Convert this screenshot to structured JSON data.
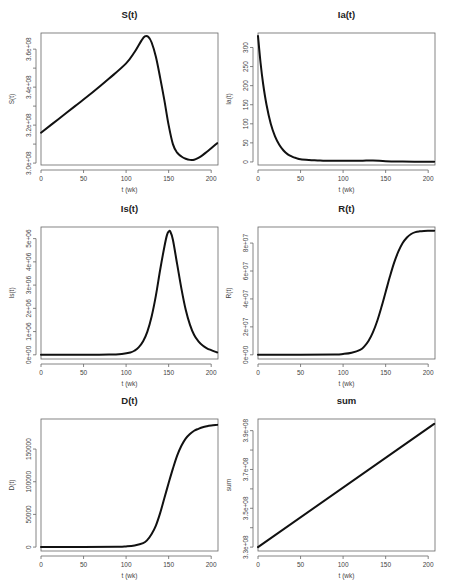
{
  "figure": {
    "layout": "3 rows x 2 columns",
    "xlabel": "t (wk)"
  },
  "chart_data": [
    {
      "id": "S",
      "type": "line",
      "title": "S(t)",
      "xlabel": "t (wk)",
      "ylabel": "S(t)",
      "xlim": [
        0,
        208
      ],
      "ylim": [
        299000000,
        368500000
      ],
      "xticks": [
        0,
        50,
        100,
        150,
        200
      ],
      "xtick_labels": [
        "0",
        "50",
        "100",
        "150",
        "200"
      ],
      "yticks": [
        300000000,
        320000000,
        340000000,
        360000000
      ],
      "ytick_labels": [
        "3.0e+08",
        "3.2e+08",
        "3.4e+08",
        "3.6e+08"
      ],
      "yminor": [
        310000000,
        330000000,
        350000000
      ],
      "x": [
        0,
        20,
        40,
        60,
        80,
        100,
        110,
        118,
        122,
        126,
        130,
        135,
        140,
        145,
        150,
        155,
        160,
        165,
        170,
        175,
        180,
        185,
        190,
        195,
        200,
        207
      ],
      "y": [
        316000000,
        323000000,
        330000000,
        337000000,
        344500000,
        352500000,
        358500000,
        364500000,
        366700000,
        366500000,
        363500000,
        356000000,
        345000000,
        333000000,
        320000000,
        310000000,
        305500000,
        303500000,
        302300000,
        301700000,
        301800000,
        302800000,
        304200000,
        306000000,
        307800000,
        310500000
      ]
    },
    {
      "id": "Ia",
      "type": "line",
      "title": "Ia(t)",
      "xlabel": "t (wk)",
      "ylabel": "Ia(t)",
      "xlim": [
        0,
        208
      ],
      "ylim": [
        -8,
        338
      ],
      "xticks": [
        0,
        50,
        100,
        150,
        200
      ],
      "xtick_labels": [
        "0",
        "50",
        "100",
        "150",
        "200"
      ],
      "yticks": [
        0,
        50,
        100,
        150,
        200,
        250,
        300
      ],
      "ytick_labels": [
        "0",
        "50",
        "100",
        "150",
        "200",
        "250",
        "300"
      ],
      "x": [
        0,
        3,
        6,
        10,
        15,
        20,
        25,
        30,
        35,
        40,
        45,
        50,
        60,
        70,
        80,
        100,
        120,
        135,
        150,
        170,
        190,
        207
      ],
      "y": [
        330,
        260,
        205,
        150,
        100,
        67,
        45,
        30,
        20,
        14,
        10,
        7,
        5,
        4,
        3,
        3,
        3,
        4,
        2,
        1,
        0.5,
        0.3
      ]
    },
    {
      "id": "Is",
      "type": "line",
      "title": "Is(t)",
      "xlabel": "t (wk)",
      "ylabel": "Is(t)",
      "xlim": [
        0,
        208
      ],
      "ylim": [
        -180000,
        5500000
      ],
      "xticks": [
        0,
        50,
        100,
        150,
        200
      ],
      "xtick_labels": [
        "0",
        "50",
        "100",
        "150",
        "200"
      ],
      "yticks": [
        0,
        1000000,
        2000000,
        3000000,
        4000000,
        5000000
      ],
      "ytick_labels": [
        "0e+00",
        "1e+06",
        "2e+06",
        "3e+06",
        "4e+06",
        "5e+06"
      ],
      "x": [
        0,
        50,
        80,
        95,
        105,
        110,
        115,
        120,
        125,
        130,
        135,
        140,
        145,
        148,
        150,
        152,
        155,
        160,
        165,
        170,
        175,
        180,
        185,
        190,
        195,
        200,
        207
      ],
      "y": [
        0,
        0,
        10000,
        40000,
        100000,
        180000,
        330000,
        580000,
        1000000,
        1650000,
        2550000,
        3650000,
        4650000,
        5150000,
        5300000,
        5300000,
        4950000,
        3900000,
        2850000,
        1950000,
        1300000,
        850000,
        580000,
        400000,
        280000,
        200000,
        100000
      ]
    },
    {
      "id": "R",
      "type": "line",
      "title": "R(t)",
      "xlabel": "t (wk)",
      "ylabel": "R(t)",
      "xlim": [
        0,
        208
      ],
      "ylim": [
        -3000000,
        91500000
      ],
      "xticks": [
        0,
        50,
        100,
        150,
        200
      ],
      "xtick_labels": [
        "0",
        "50",
        "100",
        "150",
        "200"
      ],
      "yticks": [
        0,
        20000000,
        40000000,
        60000000,
        80000000
      ],
      "ytick_labels": [
        "0e+00",
        "2e+07",
        "4e+07",
        "6e+07",
        "8e+07"
      ],
      "x": [
        0,
        50,
        90,
        100,
        110,
        120,
        125,
        130,
        135,
        140,
        145,
        150,
        155,
        160,
        165,
        170,
        175,
        180,
        185,
        190,
        195,
        200,
        207
      ],
      "y": [
        0,
        0,
        200000,
        600000,
        1500000,
        3500000,
        6000000,
        10000000,
        16000000,
        24000000,
        34000000,
        45000000,
        56000000,
        66000000,
        74000000,
        80000000,
        84000000,
        86500000,
        87800000,
        88400000,
        88700000,
        88800000,
        88800000
      ]
    },
    {
      "id": "D",
      "type": "line",
      "title": "D(t)",
      "xlabel": "t (wk)",
      "ylabel": "D(t)",
      "xlim": [
        0,
        208
      ],
      "ylim": [
        -6000,
        196000
      ],
      "xticks": [
        0,
        50,
        100,
        150,
        200
      ],
      "xtick_labels": [
        "0",
        "50",
        "100",
        "150",
        "200"
      ],
      "yticks": [
        0,
        50000,
        100000,
        150000
      ],
      "ytick_labels": [
        "0",
        "50000",
        "100000",
        "150000"
      ],
      "x": [
        0,
        50,
        90,
        100,
        110,
        120,
        125,
        130,
        135,
        140,
        145,
        150,
        155,
        160,
        165,
        170,
        175,
        180,
        185,
        190,
        195,
        200,
        207
      ],
      "y": [
        0,
        0,
        400,
        1000,
        2500,
        6000,
        11000,
        20000,
        33000,
        52000,
        75000,
        98000,
        120000,
        140000,
        155000,
        166000,
        173000,
        178000,
        181000,
        183500,
        185000,
        186000,
        187000
      ]
    },
    {
      "id": "sum",
      "type": "line",
      "title": "sum",
      "xlabel": "t (wk)",
      "ylabel": "sum",
      "xlim": [
        0,
        208
      ],
      "ylim": [
        328000000,
        396000000
      ],
      "xticks": [
        0,
        50,
        100,
        150,
        200
      ],
      "xtick_labels": [
        "0",
        "50",
        "100",
        "150",
        "200"
      ],
      "yticks": [
        330000000,
        350000000,
        370000000,
        390000000
      ],
      "ytick_labels": [
        "3.3e+08",
        "3.5e+08",
        "3.7e+08",
        "3.9e+08"
      ],
      "yminor": [
        340000000,
        360000000,
        380000000
      ],
      "x": [
        0,
        207
      ],
      "y": [
        330000000,
        393500000
      ]
    }
  ]
}
